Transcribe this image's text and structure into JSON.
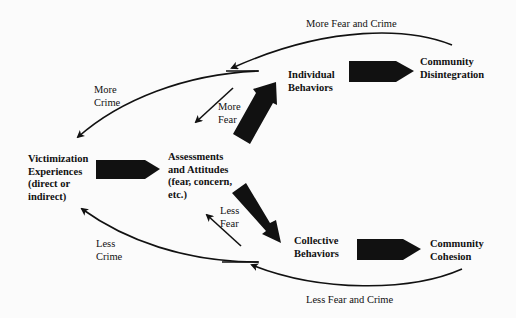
{
  "diagram": {
    "nodes": {
      "victimization": {
        "lines": [
          "Victimization",
          "Experiences",
          "(direct or",
          "indirect)"
        ]
      },
      "assessments": {
        "lines": [
          "Assessments",
          "and Attitudes",
          "(fear, concern,",
          "etc.)"
        ]
      },
      "individual": {
        "lines": [
          "Individual",
          "Behaviors"
        ]
      },
      "collective": {
        "lines": [
          "Collective",
          "Behaviors"
        ]
      },
      "disintegration": {
        "lines": [
          "Community",
          "Disintegration"
        ]
      },
      "cohesion": {
        "lines": [
          "Community",
          "Cohesion"
        ]
      }
    },
    "edge_labels": {
      "more_fear_and_crime": "More Fear and Crime",
      "more_crime": [
        "More",
        "Crime"
      ],
      "more_fear": [
        "More",
        "Fear"
      ],
      "less_fear": [
        "Less",
        "Fear"
      ],
      "less_crime": [
        "Less",
        "Crime"
      ],
      "less_fear_and_crime": "Less Fear and Crime"
    },
    "edges": [
      {
        "from": "Victimization Experiences",
        "to": "Assessments and Attitudes",
        "style": "thick"
      },
      {
        "from": "Assessments and Attitudes",
        "to": "Individual Behaviors",
        "style": "thick"
      },
      {
        "from": "Assessments and Attitudes",
        "to": "Collective Behaviors",
        "style": "thick"
      },
      {
        "from": "Individual Behaviors",
        "to": "Community Disintegration",
        "style": "thick"
      },
      {
        "from": "Collective Behaviors",
        "to": "Community Cohesion",
        "style": "thick"
      },
      {
        "from": "Community Disintegration",
        "to": "feedback-top",
        "label": "More Fear and Crime",
        "style": "curve"
      },
      {
        "from": "feedback-top",
        "to": "Victimization Experiences",
        "label": "More Crime",
        "style": "curve"
      },
      {
        "from": "feedback-top",
        "to": "Assessments and Attitudes",
        "label": "More Fear",
        "style": "thin"
      },
      {
        "from": "Community Cohesion",
        "to": "feedback-bottom",
        "label": "Less Fear and Crime",
        "style": "curve"
      },
      {
        "from": "feedback-bottom",
        "to": "Victimization Experiences",
        "label": "Less Crime",
        "style": "curve"
      },
      {
        "from": "feedback-bottom",
        "to": "Assessments and Attitudes",
        "label": "Less Fear",
        "style": "thin"
      }
    ],
    "colors": {
      "ink": "#111111",
      "background": "#fbfbfb"
    }
  }
}
